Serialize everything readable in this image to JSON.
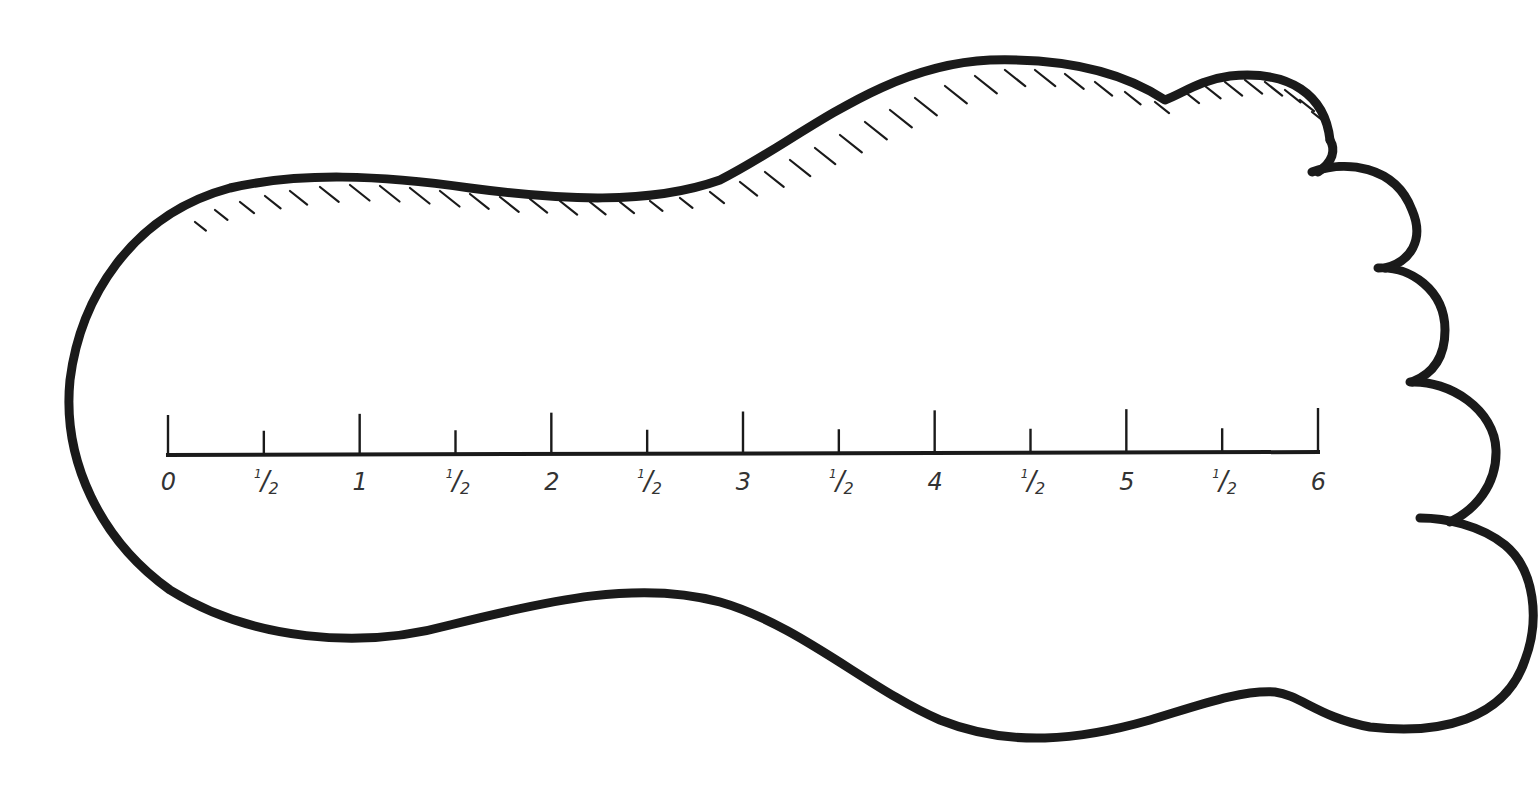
{
  "diagram": {
    "stroke_color": "#1a1a1a",
    "background_color": "#ffffff"
  },
  "ruler": {
    "unit_step": 0.5,
    "range": [
      0,
      6
    ],
    "labels": [
      {
        "value": 0,
        "text": "0",
        "kind": "whole"
      },
      {
        "value": 0.5,
        "num": "1",
        "den": "2",
        "kind": "half"
      },
      {
        "value": 1,
        "text": "1",
        "kind": "whole"
      },
      {
        "value": 1.5,
        "num": "1",
        "den": "2",
        "kind": "half"
      },
      {
        "value": 2,
        "text": "2",
        "kind": "whole"
      },
      {
        "value": 2.5,
        "num": "1",
        "den": "2",
        "kind": "half"
      },
      {
        "value": 3,
        "text": "3",
        "kind": "whole"
      },
      {
        "value": 3.5,
        "num": "1",
        "den": "2",
        "kind": "half"
      },
      {
        "value": 4,
        "text": "4",
        "kind": "whole"
      },
      {
        "value": 4.5,
        "num": "1",
        "den": "2",
        "kind": "half"
      },
      {
        "value": 5,
        "text": "5",
        "kind": "whole"
      },
      {
        "value": 5.5,
        "num": "1",
        "den": "2",
        "kind": "half"
      },
      {
        "value": 6,
        "text": "6",
        "kind": "whole"
      }
    ]
  }
}
